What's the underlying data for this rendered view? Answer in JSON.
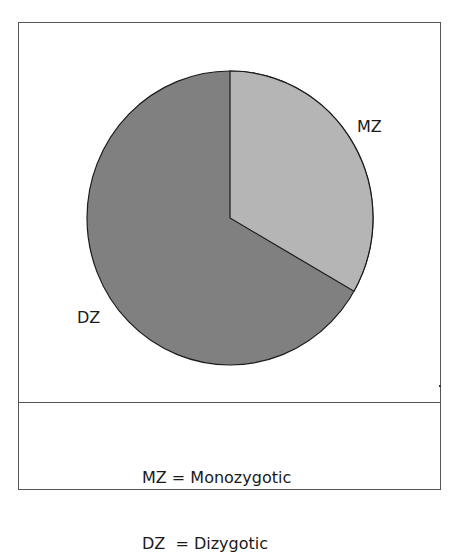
{
  "chart_data": {
    "type": "pie",
    "title": "",
    "categories": [
      "MZ",
      "DZ"
    ],
    "values": [
      33.3,
      66.7
    ],
    "units": "percent (estimated from slice angles)",
    "slice_angles_deg": [
      121,
      239
    ],
    "start_angle": "12 o'clock, clockwise",
    "colors": [
      "#b5b5b5",
      "#808080"
    ],
    "labels": {
      "MZ": "MZ",
      "DZ": "DZ"
    },
    "legend": [
      {
        "abbr": "MZ",
        "text": "MZ = Monozygotic"
      },
      {
        "abbr": "DZ",
        "text": "DZ  = Dizygotic"
      }
    ],
    "legend_position": "bottom"
  },
  "chart": {
    "slice_mz_label": "MZ",
    "slice_dz_label": "DZ",
    "colors": {
      "mz": "#b5b5b5",
      "dz": "#808080",
      "outline": "#1a1a1a",
      "frame": "#555555"
    }
  },
  "legend": {
    "line1": "MZ = Monozygotic",
    "line2": "DZ  = Dizygotic"
  }
}
